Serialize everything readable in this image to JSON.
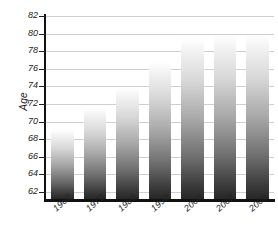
{
  "chart_data": {
    "type": "bar",
    "title": "",
    "subtitle": "",
    "xlabel": "",
    "ylabel": "Age",
    "categories": [
      "1960",
      "1970",
      "1980",
      "1990",
      "2000",
      "2002",
      "2003"
    ],
    "values": [
      69.1,
      71.5,
      73.8,
      76.8,
      79.4,
      79.9,
      79.9
    ],
    "series": [
      {
        "name": "Age",
        "values": [
          69.1,
          71.5,
          73.8,
          76.8,
          79.4,
          79.9,
          79.9
        ]
      }
    ],
    "ylim": [
      61.2,
      82.0
    ],
    "yticks": [
      62,
      64,
      66,
      68,
      70,
      72,
      74,
      76,
      78,
      80,
      82
    ],
    "ytick_labels": [
      "62",
      "64",
      "66",
      "68",
      "70",
      "72",
      "74",
      "76",
      "78",
      "80",
      "82"
    ],
    "grid": true,
    "gridlines_axis": "y",
    "legend": false,
    "legend_position": "none",
    "bar_fill": "gradient-white-to-dark-gray",
    "bar_color_top": "#ffffff",
    "bar_color_bottom": "#272727",
    "axis_color": "#111111",
    "gridline_color": "#cfcfcf",
    "text_color": "#222222",
    "background": "#ffffff",
    "xtick_label_rotation": -42
  }
}
